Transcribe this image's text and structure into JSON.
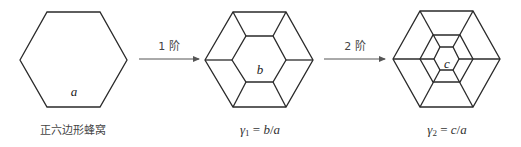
{
  "diagram": {
    "panels": [
      {
        "id": "original",
        "cell_label": "a",
        "caption": "正六边形蜂窝"
      },
      {
        "id": "first-order",
        "cell_label": "b",
        "caption_symbol": "γ",
        "caption_sub": "1",
        "caption_eq": " = ",
        "caption_expr_num": "b",
        "caption_expr_sep": "/",
        "caption_expr_den": "a"
      },
      {
        "id": "second-order",
        "cell_label": "c",
        "caption_symbol": "γ",
        "caption_sub": "2",
        "caption_eq": " = ",
        "caption_expr_num": "c",
        "caption_expr_sep": "/",
        "caption_expr_den": "a"
      }
    ],
    "arrows": [
      {
        "label": "1 阶"
      },
      {
        "label": "2 阶"
      }
    ]
  }
}
